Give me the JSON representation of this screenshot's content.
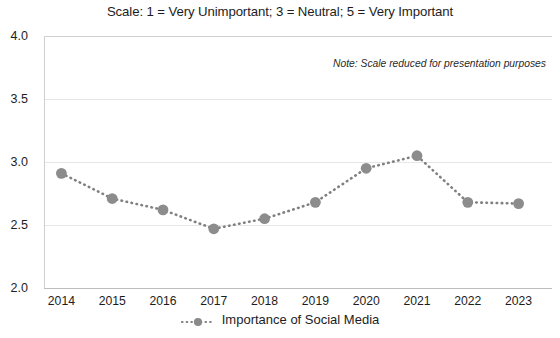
{
  "chart_data": {
    "type": "line",
    "title": "Scale: 1 = Very Unimportant; 3 = Neutral; 5 = Very Important",
    "annotation": "Note: Scale reduced for presentation purposes",
    "xlabel": "",
    "ylabel": "",
    "categories": [
      "2014",
      "2015",
      "2016",
      "2017",
      "2018",
      "2019",
      "2020",
      "2021",
      "2022",
      "2023"
    ],
    "ylim": [
      2.0,
      4.0
    ],
    "yticks": [
      "2.0",
      "2.5",
      "3.0",
      "3.5",
      "4.0"
    ],
    "ytick_values": [
      2.0,
      2.5,
      3.0,
      3.5,
      4.0
    ],
    "grid": true,
    "legend_position": "bottom",
    "series": [
      {
        "name": "Importance of Social Media",
        "color": "#808080",
        "line_style": "dotted",
        "marker": "circle",
        "values": [
          2.91,
          2.71,
          2.62,
          2.47,
          2.55,
          2.68,
          2.95,
          3.05,
          2.68,
          2.67
        ]
      }
    ]
  },
  "legend": {
    "items": [
      {
        "label": "Importance of Social Media",
        "marker": "circle-marker-icon"
      }
    ]
  }
}
